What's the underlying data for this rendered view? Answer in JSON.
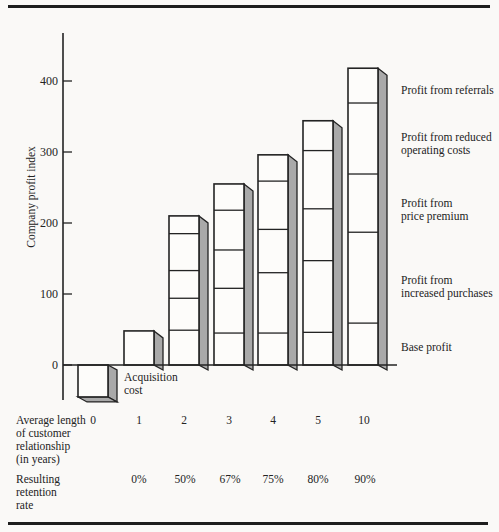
{
  "chart_data": {
    "type": "bar",
    "subtype": "stacked-3d-column",
    "title": "",
    "ylabel": "Company profit index",
    "yticks": [
      0,
      100,
      200,
      300,
      400
    ],
    "ytick_labels": [
      "0",
      "100",
      "200",
      "300",
      "400"
    ],
    "ylim": [
      -60,
      460
    ],
    "categories": [
      "0",
      "1",
      "2",
      "3",
      "4",
      "5",
      "10"
    ],
    "x_axis_label": "Average length\nof customer\nrelationship\n(in years)",
    "retention_axis_label": "Resulting\nretention\nrate",
    "retention_rates": [
      "",
      "0%",
      "50%",
      "67%",
      "75%",
      "80%",
      "90%"
    ],
    "acquisition_cost_label": "Acquisition\ncost",
    "acquisition_cost": -45,
    "totals": [
      -45,
      48,
      210,
      255,
      296,
      344,
      418
    ],
    "series": [
      {
        "name": "Base profit",
        "values": [
          0,
          48,
          49,
          45,
          45,
          46,
          59
        ]
      },
      {
        "name": "Profit from increased purchases",
        "values": [
          0,
          0,
          45,
          63,
          85,
          101,
          128
        ]
      },
      {
        "name": "Profit from price premium",
        "values": [
          0,
          0,
          39,
          54,
          61,
          73,
          82
        ]
      },
      {
        "name": "Profit from reduced operating costs",
        "values": [
          0,
          0,
          52,
          56,
          68,
          82,
          100
        ]
      },
      {
        "name": "Profit from referrals",
        "values": [
          0,
          0,
          25,
          37,
          37,
          42,
          49
        ]
      }
    ],
    "right_labels": [
      "Profit from referrals",
      "Profit from reduced\noperating costs",
      "Profit from\nprice premium",
      "Profit from\nincreased purchases",
      "Base profit"
    ],
    "legend_position": "right",
    "grid": false,
    "colors": {
      "bar_face": "#fdfcfa",
      "bar_side": "#a9a9a9",
      "line": "#232323"
    }
  }
}
